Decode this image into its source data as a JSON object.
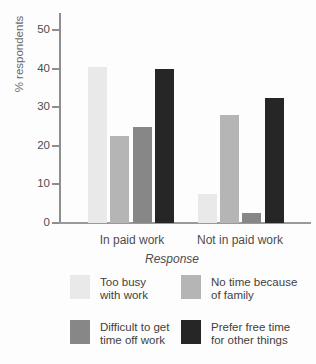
{
  "chart_data": {
    "type": "bar",
    "title": "",
    "xlabel": "Response",
    "ylabel": "% respondents",
    "categories": [
      "In paid work",
      "Not in paid work"
    ],
    "series": [
      {
        "name": "Too busy with work",
        "values": [
          40.5,
          7.5
        ],
        "color": "#e9e9e9"
      },
      {
        "name": "No time because of family",
        "values": [
          22.5,
          28
        ],
        "color": "#b5b5b5"
      },
      {
        "name": "Difficult to get time off work",
        "values": [
          25,
          2.5
        ],
        "color": "#878787"
      },
      {
        "name": "Prefer free time for other things",
        "values": [
          40,
          32.5
        ],
        "color": "#262626"
      }
    ],
    "ylim": [
      0,
      50
    ],
    "yticks": [
      0,
      10,
      20,
      30,
      40,
      50
    ],
    "grid": false,
    "legend_position": "bottom"
  },
  "legend": {
    "items": [
      {
        "line1": "Too busy",
        "line2": "with work"
      },
      {
        "line1": "No time because",
        "line2": "of family"
      },
      {
        "line1": "Difficult to get",
        "line2": "time off work"
      },
      {
        "line1": "Prefer free time",
        "line2": "for other things"
      }
    ]
  },
  "colors": {
    "axis": "#8e8e8e",
    "text": "#4d4d4d"
  }
}
